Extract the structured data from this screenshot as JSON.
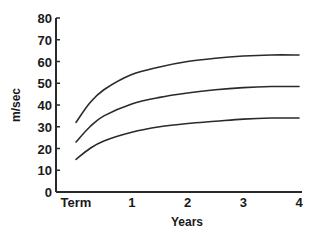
{
  "chart_data": {
    "type": "line",
    "title": "",
    "xlabel": "Years",
    "ylabel": "m/sec",
    "x_tick_labels": [
      "Term",
      "1",
      "2",
      "3",
      "4"
    ],
    "x_ticks": [
      0,
      1,
      2,
      3,
      4
    ],
    "y_ticks": [
      0,
      10,
      20,
      30,
      40,
      50,
      60,
      70,
      80
    ],
    "ylim": [
      0,
      80
    ],
    "xlim": [
      0,
      4
    ],
    "grid": false,
    "legend": null,
    "x": [
      0,
      0.25,
      0.5,
      1,
      1.5,
      2,
      2.5,
      3,
      3.5,
      4
    ],
    "series": [
      {
        "name": "upper",
        "values": [
          32,
          41,
          47,
          54,
          57.5,
          60,
          61.5,
          62.5,
          63,
          63
        ]
      },
      {
        "name": "middle",
        "values": [
          23,
          30,
          35,
          40.5,
          43.5,
          45.5,
          47,
          48,
          48.5,
          48.5
        ]
      },
      {
        "name": "lower",
        "values": [
          15,
          20,
          23.5,
          27.5,
          30,
          31.5,
          32.5,
          33.5,
          34,
          34
        ]
      }
    ],
    "line_color": "#2a2a2a"
  }
}
